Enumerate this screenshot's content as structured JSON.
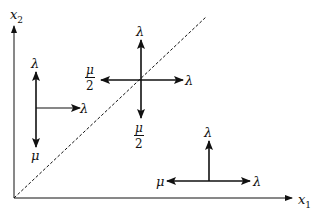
{
  "axes": {
    "x_label": "x",
    "x_sub": "1",
    "y_label": "x",
    "y_sub": "2"
  },
  "diagonal": {
    "style": "dashed",
    "from": [
      14,
      198
    ],
    "to": [
      206,
      17
    ]
  },
  "crosses": [
    {
      "name": "left",
      "up_label": "λ",
      "down_label": "μ",
      "right_label": "λ"
    },
    {
      "name": "center",
      "up_label": "λ",
      "right_label": "λ",
      "left_num": "μ",
      "left_den": "2",
      "down_num": "μ",
      "down_den": "2"
    },
    {
      "name": "bottom-right",
      "up_label": "λ",
      "left_label": "μ",
      "right_label": "λ"
    }
  ],
  "colors": {
    "line": "#111111",
    "background": "#ffffff"
  }
}
